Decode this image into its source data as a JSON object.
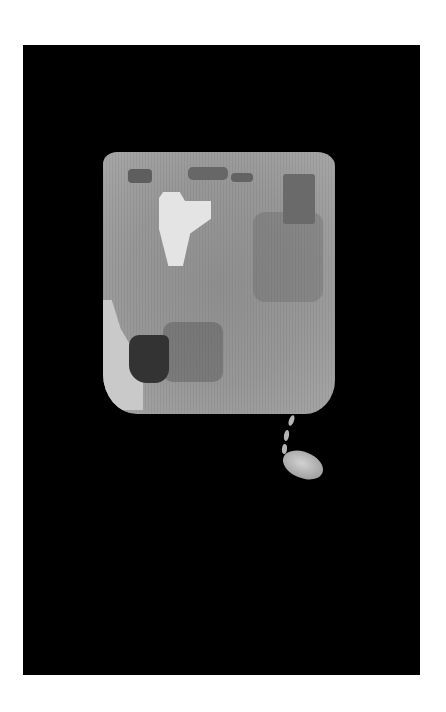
{
  "image": {
    "description": "Photograph of a worn rectangular textile fragment with a hanging tassel and oval pendant, shown against a black background within a white border",
    "colors": {
      "border": "#ffffff",
      "background": "#000000",
      "textile": "#979797",
      "highlight": "#e4e4e4"
    }
  }
}
